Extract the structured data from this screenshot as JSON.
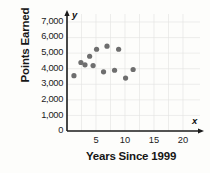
{
  "chart_data": {
    "type": "scatter",
    "title": "",
    "xlabel": "Years Since 1999",
    "ylabel": "Points Earned",
    "xlim": [
      0,
      22
    ],
    "ylim": [
      0,
      7600
    ],
    "xticks": [
      5,
      10,
      15,
      20
    ],
    "yticks": [
      0,
      1000,
      2000,
      3000,
      4000,
      5000,
      6000,
      7000
    ],
    "xtick_labels": [
      "5",
      "10",
      "15",
      "20"
    ],
    "ytick_labels": [
      "0",
      "1,000",
      "2,000",
      "3,000",
      "4,000",
      "5,000",
      "6,000",
      "7,000"
    ],
    "grid": true,
    "legend": null,
    "x_axis_letter": "x",
    "y_axis_letter": "y",
    "marker_color": "#6e6e6e",
    "axis_color": "#1a1a1a",
    "points": [
      {
        "x": 1.2,
        "y": 3550
      },
      {
        "x": 2.4,
        "y": 4400
      },
      {
        "x": 3.1,
        "y": 4250
      },
      {
        "x": 3.9,
        "y": 4800
      },
      {
        "x": 5.1,
        "y": 5250
      },
      {
        "x": 6.3,
        "y": 3800
      },
      {
        "x": 6.9,
        "y": 5450
      },
      {
        "x": 8.2,
        "y": 3900
      },
      {
        "x": 8.9,
        "y": 5250
      },
      {
        "x": 10.1,
        "y": 3400
      },
      {
        "x": 11.4,
        "y": 3950
      },
      {
        "x": 4.5,
        "y": 4200
      }
    ]
  },
  "axis": {
    "y_label": "Points Earned",
    "x_label": "Years Since 1999",
    "y_letter": "y",
    "x_letter": "x",
    "y_ticks": [
      "7,000",
      "6,000",
      "5,000",
      "4,000",
      "3,000",
      "2,000",
      "1,000",
      "0"
    ],
    "x_ticks": [
      "5",
      "10",
      "15",
      "20"
    ]
  }
}
